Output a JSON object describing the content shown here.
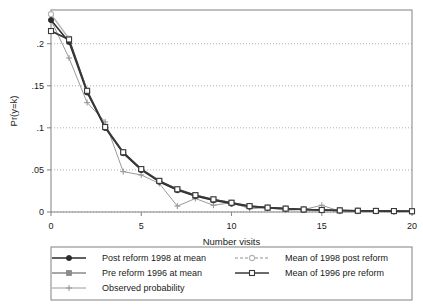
{
  "chart_data": {
    "type": "line",
    "title": "",
    "xlabel": "Number visits",
    "ylabel": "Pr(y=k)",
    "xlim": [
      0,
      20
    ],
    "ylim": [
      0,
      0.24
    ],
    "xticks": [
      0,
      5,
      10,
      15,
      20
    ],
    "xtick_labels": [
      "0",
      "5",
      "10",
      "15",
      "20"
    ],
    "yticks": [
      0,
      0.05,
      0.1,
      0.15,
      0.2
    ],
    "ytick_labels": [
      "0",
      ".05",
      ".1",
      ".15",
      ".2"
    ],
    "grid": "horizontal-dotted",
    "legend_position": "bottom-outside",
    "x": [
      0,
      1,
      2,
      3,
      4,
      5,
      6,
      7,
      8,
      9,
      10,
      11,
      12,
      13,
      14,
      15,
      16,
      17,
      18,
      19,
      20
    ],
    "series": [
      {
        "name": "Post reform 1998 at mean",
        "marker": "filled-circle",
        "color": "#2b2b2b",
        "values": [
          0.228,
          0.202,
          0.142,
          0.1,
          0.07,
          0.05,
          0.036,
          0.026,
          0.019,
          0.014,
          0.01,
          0.0065,
          0.005,
          0.0038,
          0.0028,
          0.0022,
          0.0018,
          0.0014,
          0.0012,
          0.001,
          0.0008
        ]
      },
      {
        "name": "Pre reform 1996 at mean",
        "marker": "filled-square",
        "color": "#8a8a8a",
        "values": [
          0.215,
          0.205,
          0.144,
          0.101,
          0.071,
          0.051,
          0.037,
          0.027,
          0.02,
          0.015,
          0.011,
          0.007,
          0.0052,
          0.004,
          0.003,
          0.0024,
          0.0019,
          0.0015,
          0.0013,
          0.0011,
          0.0009
        ]
      },
      {
        "name": "Observed probability",
        "marker": "plus",
        "color": "#9a9a9a",
        "values": [
          0.228,
          0.183,
          0.13,
          0.107,
          0.048,
          0.044,
          0.034,
          0.007,
          0.016,
          0.008,
          0.011,
          0.004,
          0.005,
          0.002,
          0.003,
          0.008,
          0.001,
          0.001,
          0.001,
          0.0,
          0.001
        ]
      },
      {
        "name": "Mean of 1998 post reform",
        "marker": "open-circle",
        "color": "#b5b5b5",
        "values": [
          0.235,
          0.206,
          0.143,
          0.1,
          0.07,
          0.05,
          0.036,
          0.026,
          0.019,
          0.014,
          0.01,
          0.0065,
          0.005,
          0.0038,
          0.0028,
          0.0022,
          0.0018,
          0.0014,
          0.0012,
          0.001,
          0.0008
        ]
      },
      {
        "name": "Mean of 1996 pre reform",
        "marker": "open-square",
        "color": "#3a3a3a",
        "values": [
          0.215,
          0.205,
          0.144,
          0.101,
          0.071,
          0.051,
          0.037,
          0.027,
          0.02,
          0.015,
          0.011,
          0.007,
          0.0052,
          0.004,
          0.003,
          0.0024,
          0.0019,
          0.0015,
          0.0013,
          0.0011,
          0.0009
        ]
      }
    ]
  },
  "legend": {
    "entries": [
      {
        "label": "Post reform 1998 at mean",
        "marker": "filled-circle",
        "color": "#2b2b2b"
      },
      {
        "label": "Mean of 1998 post reform",
        "marker": "open-circle",
        "color": "#b5b5b5"
      },
      {
        "label": "Pre reform 1996 at mean",
        "marker": "filled-square",
        "color": "#8a8a8a"
      },
      {
        "label": "Mean of 1996 pre reform",
        "marker": "open-square",
        "color": "#3a3a3a"
      },
      {
        "label": "Observed probability",
        "marker": "plus",
        "color": "#9a9a9a"
      }
    ]
  },
  "colors": {
    "frame": "#8c8c8c",
    "grid": "#9a9a9a",
    "text": "#1a1a1a",
    "background": "#ffffff"
  }
}
